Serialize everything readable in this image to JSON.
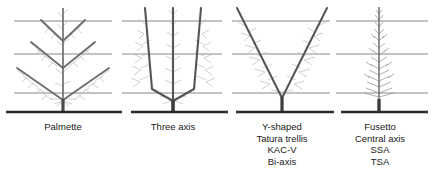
{
  "figure": {
    "background_color": "#ffffff",
    "ground_line_color": "#2b2b2b",
    "wire_line_color": "#7a7a7a",
    "branch_color": "#6e6e6e",
    "twig_color": "#b4b4b4",
    "trunk_color": "#4a4a4a"
  },
  "wires": {
    "count": 3,
    "y_positions": [
      21,
      54,
      93
    ],
    "ground_y": 112
  },
  "panels": [
    {
      "id": "palmette",
      "trunk_x": 63,
      "caption_lines": [
        "Palmette"
      ]
    },
    {
      "id": "three-axis",
      "trunk_x": 173,
      "caption_lines": [
        "Three axis"
      ]
    },
    {
      "id": "y-shaped",
      "trunk_x": 282,
      "caption_lines": [
        "Y-shaped",
        "Tatura trellis",
        "KAC-V",
        "Bi-axis"
      ]
    },
    {
      "id": "fusetto",
      "trunk_x": 379,
      "caption_lines": [
        "Fusetto",
        "Central axis",
        "SSA",
        "TSA"
      ]
    }
  ],
  "captions": {
    "palmette": {
      "l1": "Palmette"
    },
    "three_axis": {
      "l1": "Three axis"
    },
    "y_shaped": {
      "l1": "Y-shaped",
      "l2": "Tatura trellis",
      "l3": "KAC-V",
      "l4": "Bi-axis"
    },
    "fusetto": {
      "l1": "Fusetto",
      "l2": "Central axis",
      "l3": "SSA",
      "l4": "TSA"
    }
  }
}
